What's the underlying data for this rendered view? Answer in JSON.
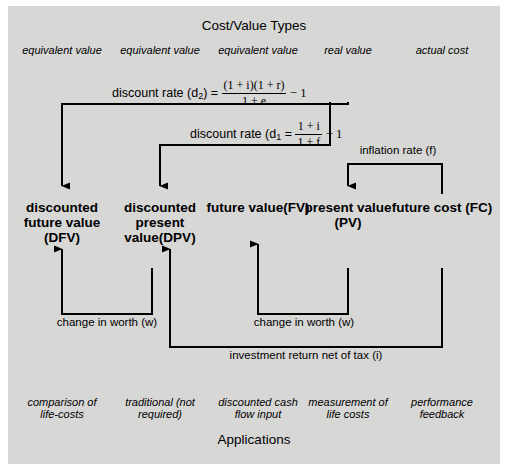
{
  "diagram": {
    "title_top": "Cost/Value Types",
    "title_bottom": "Applications",
    "type_labels": [
      {
        "text": "equivalent value",
        "x": 62
      },
      {
        "text": "equivalent value",
        "x": 160
      },
      {
        "text": "equivalent value",
        "x": 258
      },
      {
        "text": "real value",
        "x": 348
      },
      {
        "text": "actual  cost",
        "x": 442
      }
    ],
    "nodes": [
      {
        "name": "discounted-future-value",
        "lines": [
          "discounted",
          "future value",
          "(DFV)"
        ],
        "x": 62
      },
      {
        "name": "discounted-present-value",
        "lines": [
          "discounted",
          "present",
          "value(DPV)"
        ],
        "x": 160
      },
      {
        "name": "future-value",
        "lines": [
          "future value(FV)"
        ],
        "x": 258
      },
      {
        "name": "present-value",
        "lines": [
          "present value",
          "(PV)"
        ],
        "x": 348
      },
      {
        "name": "future-cost",
        "lines": [
          "future cost (FC)"
        ],
        "x": 442
      }
    ],
    "formulas": {
      "d2": {
        "label": "discount rate (d",
        "sub": "2",
        "label_end": ") =",
        "numerator": "(1 + i)(1 + r)",
        "denominator": "1 + e",
        "tail": "− 1"
      },
      "d1": {
        "label": "discount rate (d",
        "sub": "1",
        "label_end": "  =",
        "numerator": "1 + i",
        "denominator": "1 + f",
        "tail": "− 1"
      }
    },
    "edge_labels": [
      {
        "name": "inflation-rate",
        "text": "inflation rate (f)",
        "x": 390,
        "y": 148
      },
      {
        "name": "change-in-worth-left",
        "text": "change in worth (w)",
        "x": 107,
        "y": 317
      },
      {
        "name": "change-in-worth-right",
        "text": "change in worth (w)",
        "x": 304,
        "y": 317
      },
      {
        "name": "investment-return",
        "text": "investment return net of tax (i)",
        "x": 306,
        "y": 350
      }
    ],
    "applications": [
      {
        "lines": [
          "comparison of",
          "life-costs"
        ],
        "x": 62
      },
      {
        "lines": [
          "traditional (not",
          "required)"
        ],
        "x": 160
      },
      {
        "lines": [
          "discounted cash",
          "flow input"
        ],
        "x": 258
      },
      {
        "lines": [
          "measurement of",
          "life costs"
        ],
        "x": 348
      },
      {
        "lines": [
          "performance",
          "feedback"
        ],
        "x": 442
      }
    ],
    "colors": {
      "background": "#d7d7d6",
      "stroke": "#000000",
      "page": "#ffffff"
    }
  }
}
